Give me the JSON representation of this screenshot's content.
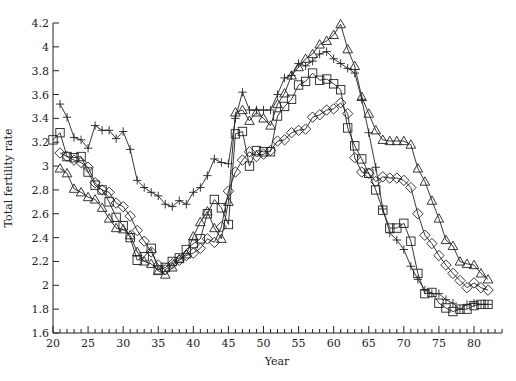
{
  "chart_data": {
    "type": "line",
    "title": "",
    "xlabel": "Year",
    "ylabel": "Total fertility rate",
    "xlim": [
      20,
      84
    ],
    "ylim": [
      1.6,
      4.2
    ],
    "xticks": [
      20,
      25,
      30,
      35,
      40,
      45,
      50,
      55,
      60,
      65,
      70,
      75,
      80
    ],
    "xtick_labels": [
      "20",
      "25",
      "30",
      "35",
      "40",
      "45",
      "50",
      "55",
      "60",
      "65",
      "70",
      "75",
      "80"
    ],
    "yticks": [
      1.6,
      1.8,
      2,
      2.2,
      2.4,
      2.6,
      2.8,
      3,
      3.2,
      3.4,
      3.6,
      3.8,
      4,
      4.2
    ],
    "ytick_labels": [
      "1.6",
      "1.8",
      "2",
      "2.2",
      "2.4",
      "2.6",
      "2.8",
      "3",
      "3.2",
      "3.4",
      "3.6",
      "3.8",
      "4",
      "4.2"
    ],
    "grid": false,
    "legend": "none",
    "series": [
      {
        "name": "plus",
        "marker": "plus",
        "x": [
          21,
          22,
          23,
          24,
          25,
          26,
          27,
          28,
          29,
          30,
          31,
          32,
          33,
          34,
          35,
          36,
          37,
          38,
          39,
          40,
          41,
          42,
          43,
          44,
          45,
          46,
          47,
          48,
          49,
          50,
          51,
          52,
          53,
          54,
          55,
          56,
          57,
          58,
          59,
          60,
          61,
          62,
          63,
          64,
          65,
          66,
          67,
          68,
          69,
          70,
          71,
          72,
          73,
          74,
          75,
          76,
          77,
          78,
          79,
          80,
          81,
          82
        ],
        "values": [
          3.52,
          3.41,
          3.24,
          3.22,
          3.15,
          3.34,
          3.3,
          3.3,
          3.23,
          3.29,
          3.14,
          2.88,
          2.82,
          2.78,
          2.75,
          2.68,
          2.66,
          2.71,
          2.68,
          2.78,
          2.82,
          2.92,
          3.06,
          3.03,
          3.02,
          3.4,
          3.62,
          3.47,
          3.47,
          3.47,
          3.47,
          3.6,
          3.74,
          3.76,
          3.86,
          3.84,
          3.88,
          3.94,
          3.96,
          3.9,
          3.86,
          3.82,
          3.78,
          3.56,
          3.28,
          2.99,
          2.64,
          2.44,
          2.38,
          2.3,
          2.16,
          2.05,
          1.96,
          1.93,
          1.93,
          1.88,
          1.85,
          1.8,
          1.84,
          1.85,
          1.84,
          1.84
        ]
      },
      {
        "name": "square",
        "marker": "square",
        "x": [
          20,
          21,
          22,
          23,
          24,
          25,
          26,
          27,
          28,
          29,
          30,
          31,
          32,
          33,
          34,
          35,
          36,
          37,
          38,
          39,
          40,
          41,
          42,
          43,
          44,
          45,
          46,
          47,
          48,
          49,
          50,
          51,
          52,
          53,
          54,
          55,
          56,
          57,
          58,
          59,
          60,
          61,
          62,
          63,
          64,
          65,
          66,
          67,
          68,
          69,
          70,
          71,
          72,
          73,
          74,
          75,
          76,
          77,
          78,
          79,
          80,
          81,
          82
        ],
        "values": [
          3.22,
          3.28,
          3.08,
          3.07,
          3.08,
          2.95,
          2.84,
          2.8,
          2.7,
          2.57,
          2.5,
          2.4,
          2.21,
          2.24,
          2.31,
          2.13,
          2.15,
          2.2,
          2.23,
          2.3,
          2.35,
          2.39,
          2.6,
          2.72,
          2.65,
          2.51,
          3.27,
          3.29,
          3.0,
          3.13,
          3.12,
          3.12,
          3.42,
          3.5,
          3.56,
          3.68,
          3.71,
          3.78,
          3.72,
          3.73,
          3.69,
          3.64,
          3.32,
          3.17,
          3.06,
          2.94,
          2.8,
          2.63,
          2.48,
          2.48,
          2.52,
          2.37,
          2.1,
          1.93,
          1.94,
          1.85,
          1.81,
          1.78,
          1.8,
          1.8,
          1.83,
          1.84,
          1.84
        ]
      },
      {
        "name": "diamond",
        "marker": "diamond",
        "x": [
          21,
          22,
          23,
          24,
          25,
          26,
          27,
          28,
          29,
          30,
          31,
          32,
          33,
          34,
          35,
          36,
          37,
          38,
          39,
          40,
          41,
          42,
          43,
          44,
          45,
          46,
          47,
          48,
          49,
          50,
          51,
          52,
          53,
          54,
          55,
          56,
          57,
          58,
          59,
          60,
          61,
          62,
          63,
          64,
          65,
          66,
          67,
          68,
          69,
          70,
          71,
          72,
          73,
          74,
          75,
          76,
          77,
          78,
          79,
          80,
          81,
          82
        ],
        "values": [
          3.11,
          3.08,
          3.05,
          3.03,
          2.99,
          2.86,
          2.8,
          2.78,
          2.69,
          2.66,
          2.58,
          2.46,
          2.37,
          2.28,
          2.17,
          2.13,
          2.18,
          2.21,
          2.25,
          2.27,
          2.31,
          2.39,
          2.36,
          2.49,
          2.79,
          2.95,
          3.05,
          3.12,
          3.08,
          3.1,
          3.13,
          3.21,
          3.22,
          3.28,
          3.3,
          3.31,
          3.41,
          3.43,
          3.47,
          3.48,
          3.53,
          3.44,
          3.07,
          2.95,
          2.94,
          2.87,
          2.91,
          2.9,
          2.9,
          2.88,
          2.82,
          2.6,
          2.42,
          2.35,
          2.25,
          2.17,
          2.1,
          2.04,
          1.98,
          2.02,
          1.98,
          1.96
        ]
      },
      {
        "name": "triangle",
        "marker": "triangle",
        "x": [
          21,
          22,
          23,
          24,
          25,
          26,
          27,
          28,
          29,
          30,
          31,
          32,
          33,
          34,
          35,
          36,
          37,
          38,
          39,
          40,
          41,
          42,
          43,
          44,
          45,
          46,
          47,
          48,
          49,
          50,
          51,
          52,
          53,
          54,
          55,
          56,
          57,
          58,
          59,
          60,
          61,
          62,
          63,
          64,
          65,
          66,
          67,
          68,
          69,
          70,
          71,
          72,
          73,
          74,
          75,
          76,
          77,
          78,
          79,
          80,
          81,
          82
        ],
        "values": [
          2.98,
          2.94,
          2.81,
          2.78,
          2.74,
          2.72,
          2.65,
          2.56,
          2.48,
          2.47,
          2.42,
          2.28,
          2.2,
          2.18,
          2.12,
          2.09,
          2.15,
          2.22,
          2.26,
          2.41,
          2.53,
          2.62,
          2.48,
          2.39,
          2.7,
          3.45,
          3.47,
          3.38,
          3.45,
          3.4,
          3.34,
          3.52,
          3.61,
          3.76,
          3.83,
          3.9,
          3.94,
          4.02,
          4.05,
          4.1,
          4.19,
          3.98,
          3.84,
          3.58,
          3.44,
          3.3,
          3.22,
          3.21,
          3.21,
          3.21,
          3.18,
          2.98,
          2.87,
          2.71,
          2.56,
          2.38,
          2.33,
          2.2,
          2.18,
          2.17,
          2.1,
          2.05
        ]
      }
    ]
  }
}
